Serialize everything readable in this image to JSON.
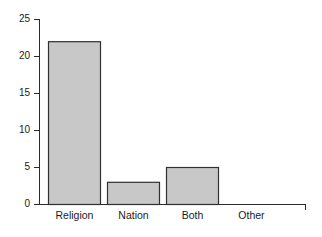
{
  "chart_data": {
    "type": "bar",
    "title": "",
    "subtitle": "",
    "xlabel": "",
    "ylabel": "",
    "categories": [
      "Religion",
      "Nation",
      "Both",
      "Other"
    ],
    "values": [
      22,
      3,
      5,
      0
    ],
    "series": [
      {
        "name": "Count",
        "values": [
          22,
          3,
          5,
          0
        ]
      }
    ],
    "ylim": [
      0,
      25
    ],
    "yticks": [
      0,
      5,
      10,
      15,
      20,
      25
    ],
    "ytick_labels": [
      "0",
      "5",
      "10",
      "15",
      "20",
      "25"
    ],
    "xtick_labels": [
      "Religion",
      "Nation",
      "Both",
      "Other"
    ],
    "grid": false,
    "legend": false,
    "legend_position": "none",
    "annotations": []
  },
  "style": {
    "bar_fill": "#c8c8c8",
    "bar_edge": "#303030",
    "axis_color": "#2b2b2b",
    "text_color": "#1a1a1a",
    "background": "#ffffff"
  }
}
